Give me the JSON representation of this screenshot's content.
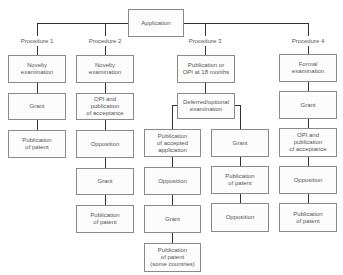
{
  "root": {
    "label": "Application"
  },
  "procedures": [
    {
      "label": "Procedure 1",
      "steps": [
        "Novelty\nexamination",
        "Grant",
        "Publication\nof patent"
      ]
    },
    {
      "label": "Procedure 2",
      "steps": [
        "Novelty\nexamination",
        "OPI and\npublication\nof acceptance",
        "Opposition",
        "Grant",
        "Publication\nof patent"
      ]
    },
    {
      "label": "Procedure 3",
      "steps": [
        "Publication or\nOPI at 18 months",
        "Deferred/optional\nexamination"
      ],
      "branches": [
        {
          "steps": [
            "Publication\nof accepted\napplication",
            "Opposition",
            "Grant",
            "Publication\nof patent\n(some countries)"
          ]
        },
        {
          "steps": [
            "Grant",
            "Publication\nof patent",
            "Opposition"
          ]
        }
      ]
    },
    {
      "label": "Procedure 4",
      "steps": [
        "Formal\nexamination",
        "Grant",
        "OPI and\npublication\nof acceptance",
        "Opposition",
        "Publication\nof patent"
      ]
    }
  ]
}
